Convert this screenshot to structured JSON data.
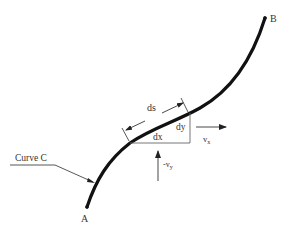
{
  "diagram": {
    "points": {
      "start": {
        "label": "A"
      },
      "end": {
        "label": "B"
      }
    },
    "curve": {
      "label": "Curve C"
    },
    "element": {
      "arc_length_label": "ds",
      "horizontal_label": "dx",
      "vertical_label": "dy"
    },
    "velocities": {
      "horizontal": {
        "label": "v",
        "subscript": "x"
      },
      "vertical": {
        "label": "-v",
        "subscript": "y"
      }
    },
    "colors": {
      "curve": "#111111",
      "lines": "#555555",
      "text": "#333333",
      "background": "#ffffff"
    }
  }
}
